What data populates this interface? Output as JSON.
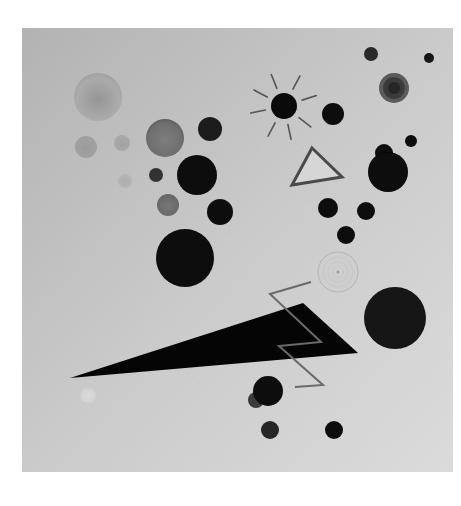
{
  "artwork": {
    "page_background": "#ffffff",
    "canvas": {
      "x": 22,
      "y": 28,
      "width": 431,
      "height": 444,
      "gradient": {
        "top_left": "#b5b5b5",
        "center": "#cdcdcd",
        "bottom_right": "#dedede"
      }
    },
    "soft_circles": [
      {
        "name": "faded-large-circle",
        "cx": 98,
        "cy": 97,
        "r": 24,
        "fill": "#a6a6a6",
        "edge": "#9a9a9a",
        "core": "#8a8a8a",
        "opacity": 0.75
      },
      {
        "name": "gray-circle-left",
        "cx": 86,
        "cy": 147,
        "r": 11,
        "fill": "#9c9c9c",
        "edge": "#9c9c9c",
        "core": "#959595",
        "opacity": 0.85
      },
      {
        "name": "gray-circle-small",
        "cx": 122,
        "cy": 143,
        "r": 8,
        "fill": "#a5a5a5",
        "edge": "#a5a5a5",
        "core": "#9d9d9d",
        "opacity": 0.85
      },
      {
        "name": "faint-circle",
        "cx": 125,
        "cy": 181,
        "r": 7,
        "fill": "#b2b2b2",
        "edge": "#b2b2b2",
        "core": "#aaaaaa",
        "opacity": 0.8
      },
      {
        "name": "gray-sphere",
        "cx": 165,
        "cy": 138,
        "r": 19,
        "fill": "#6f6f6f",
        "edge": "#5e5e5e",
        "core": "#7d7d7d",
        "opacity": 1
      },
      {
        "name": "gray-circle-mid",
        "cx": 168,
        "cy": 205,
        "r": 11,
        "fill": "#6a6a6a",
        "edge": "#626262",
        "core": "#767676",
        "opacity": 1
      },
      {
        "name": "faint-white-circle",
        "cx": 88,
        "cy": 395,
        "r": 8,
        "fill": "#d8d8d8",
        "edge": "#d0d0d0",
        "core": "#e4e4e4",
        "opacity": 0.7
      }
    ],
    "dark_circles": [
      {
        "name": "dark-circle-a",
        "cx": 210,
        "cy": 129,
        "r": 12,
        "fill": "#1e1e1e"
      },
      {
        "name": "dark-circle-b",
        "cx": 156,
        "cy": 175,
        "r": 7,
        "fill": "#333333"
      },
      {
        "name": "dark-circle-c",
        "cx": 197,
        "cy": 175,
        "r": 20,
        "fill": "#0a0a0a"
      },
      {
        "name": "dark-circle-d",
        "cx": 220,
        "cy": 212,
        "r": 13,
        "fill": "#0d0d0d"
      },
      {
        "name": "dark-circle-large",
        "cx": 185,
        "cy": 258,
        "r": 29,
        "fill": "#080808"
      },
      {
        "name": "dark-circle-e",
        "cx": 333,
        "cy": 114,
        "r": 11,
        "fill": "#0d0d0d"
      },
      {
        "name": "dark-circle-top-1",
        "cx": 371,
        "cy": 54,
        "r": 7,
        "fill": "#2a2a2a"
      },
      {
        "name": "dark-circle-top-2",
        "cx": 429,
        "cy": 58,
        "r": 5,
        "fill": "#151515"
      },
      {
        "name": "dark-circle-small-right",
        "cx": 411,
        "cy": 141,
        "r": 6,
        "fill": "#111111"
      },
      {
        "name": "dark-circle-bump",
        "cx": 384,
        "cy": 153,
        "r": 9,
        "fill": "#0a0a0a"
      },
      {
        "name": "dark-circle-right-big",
        "cx": 388,
        "cy": 172,
        "r": 20,
        "fill": "#080808"
      },
      {
        "name": "dark-circle-f",
        "cx": 328,
        "cy": 208,
        "r": 10,
        "fill": "#0d0d0d"
      },
      {
        "name": "dark-circle-g",
        "cx": 366,
        "cy": 211,
        "r": 9,
        "fill": "#0d0d0d"
      },
      {
        "name": "dark-circle-h",
        "cx": 346,
        "cy": 235,
        "r": 9,
        "fill": "#0d0d0d"
      },
      {
        "name": "dark-circle-lower-right",
        "cx": 395,
        "cy": 318,
        "r": 31,
        "fill": "#141414"
      },
      {
        "name": "dark-circle-bottom-satellite",
        "cx": 256,
        "cy": 400,
        "r": 8,
        "fill": "#3a3a3a"
      },
      {
        "name": "dark-circle-bottom",
        "cx": 268,
        "cy": 391,
        "r": 15,
        "fill": "#0a0a0a"
      },
      {
        "name": "dark-circle-bottom-left",
        "cx": 270,
        "cy": 430,
        "r": 9,
        "fill": "#262626"
      },
      {
        "name": "dark-circle-bottom-right",
        "cx": 334,
        "cy": 430,
        "r": 9,
        "fill": "#0d0d0d"
      }
    ],
    "ringed_circle": {
      "cx": 394,
      "cy": 88,
      "r": 15,
      "outer": "#5a5a5a",
      "mid": "#3a3a3a",
      "inner": "#262626"
    },
    "radial_circle": {
      "cx": 338,
      "cy": 272,
      "r": 20,
      "fill": "#cfcfcf",
      "stroke": "#a8a8a8",
      "center_dot": "#9a9a9a"
    },
    "sun": {
      "cx": 284,
      "cy": 106,
      "r": 13,
      "fill": "#0a0a0a",
      "ray_color": "#555555",
      "ray_inner": 19,
      "ray_outer": 34,
      "ray_angles": [
        -112,
        -62,
        -18,
        38,
        78,
        118,
        168,
        208
      ]
    },
    "triangle": {
      "points": "312,148 342,177 292,185",
      "fill": "#d6d6d6",
      "stroke": "#4a4a4a",
      "stroke_width": 3
    },
    "wedge": {
      "points": "70,378 303,303 358,353",
      "fill": "#050505"
    },
    "zigzag": {
      "points": "311,282 270,294 321,342 279,346 323,385 295,387",
      "stroke": "#6a6a6a",
      "stroke_width": 2
    }
  }
}
